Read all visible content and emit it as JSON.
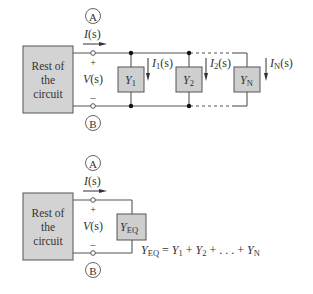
{
  "top_circuit": {
    "source_block": {
      "line1": "Rest of",
      "line2": "the",
      "line3": "circuit"
    },
    "node_a": "A",
    "node_b": "B",
    "current": "I(s)",
    "current_main": "I",
    "current_arg": "(s)",
    "voltage": "V(s)",
    "voltage_main": "V",
    "voltage_arg": "(s)",
    "plus": "+",
    "minus": "–",
    "branches": [
      {
        "admittance": "Y",
        "sub": "1",
        "current": "I",
        "current_sub": "1",
        "current_arg": "(s)"
      },
      {
        "admittance": "Y",
        "sub": "2",
        "current": "I",
        "current_sub": "2",
        "current_arg": "(s)"
      },
      {
        "admittance": "Y",
        "sub": "N",
        "current": "I",
        "current_sub": "N",
        "current_arg": "(s)"
      }
    ]
  },
  "bottom_circuit": {
    "source_block": {
      "line1": "Rest of",
      "line2": "the",
      "line3": "circuit"
    },
    "node_a": "A",
    "node_b": "B",
    "current_main": "I",
    "current_arg": "(s)",
    "voltage_main": "V",
    "voltage_arg": "(s)",
    "plus": "+",
    "minus": "–",
    "equivalent": {
      "admittance": "Y",
      "sub": "EQ"
    },
    "equation": {
      "lhs": "Y",
      "lhs_sub": "EQ",
      "eq": " = ",
      "t1": "Y",
      "t1_sub": "1",
      "plus1": " + ",
      "t2": "Y",
      "t2_sub": "2",
      "ellipsis": " + . . . + ",
      "tn": "Y",
      "tn_sub": "N"
    }
  },
  "colors": {
    "block_fill": "#cfcfcf",
    "wire": "#555555",
    "text": "#333333"
  }
}
